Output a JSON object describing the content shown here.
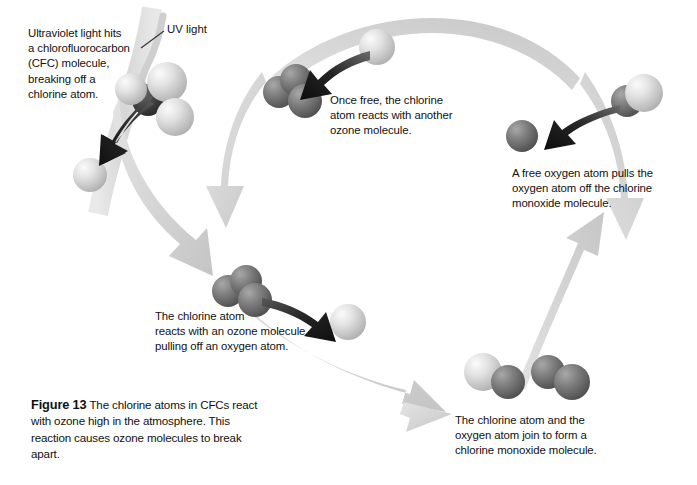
{
  "figure": {
    "number_label": "Figure 13",
    "caption_text": " The chlorine atoms in CFCs react with ozone high in the atmosphere. This reaction causes ozone molecules to break apart."
  },
  "annotations": {
    "uv_light_label": "UV light"
  },
  "steps": [
    {
      "id": "step1",
      "lines": [
        "Ultraviolet light hits",
        "a chlorofluorocarbon",
        "(CFC) molecule,",
        "breaking off a",
        "chlorine atom."
      ]
    },
    {
      "id": "step2",
      "lines": [
        "Once free, the chlorine",
        "atom reacts with another",
        "ozone molecule."
      ]
    },
    {
      "id": "step3",
      "lines": [
        "A free oxygen atom pulls the",
        "oxygen atom off the chlorine",
        "monoxide molecule."
      ]
    },
    {
      "id": "step4",
      "lines": [
        "The chlorine atom",
        "reacts with an ozone molecule,",
        "pulling off an oxygen atom."
      ]
    },
    {
      "id": "step5",
      "lines": [
        "The chlorine atom and the",
        "oxygen atom join to form a",
        "chlorine monoxide molecule."
      ]
    }
  ],
  "colors": {
    "background": "#ffffff",
    "cycle_arrow": "#d6d6d6",
    "cycle_arrow_shade": "#c2c2c2",
    "reaction_arrow": "#1a1a1a",
    "light_atom": "#cdcdcd",
    "light_atom_highlight": "#f2f2f2",
    "dark_atom": "#6d6d6d",
    "dark_atom_highlight": "#9a9a9a",
    "text": "#111111",
    "uv_beam": "#d9d9d9"
  },
  "molecules": [
    {
      "name": "cfc-molecule",
      "atoms": [
        "light",
        "light",
        "light",
        "dark"
      ]
    },
    {
      "name": "free-chlorine-atom",
      "atoms": [
        "light"
      ]
    },
    {
      "name": "ozone-molecule-upper",
      "atoms": [
        "dark",
        "dark",
        "dark"
      ]
    },
    {
      "name": "chlorine-atom-incoming",
      "atoms": [
        "light"
      ]
    },
    {
      "name": "chlorine-monoxide-molecule-upper",
      "atoms": [
        "dark",
        "light"
      ]
    },
    {
      "name": "free-oxygen-atom",
      "atoms": [
        "dark"
      ]
    },
    {
      "name": "ozone-molecule-lower",
      "atoms": [
        "dark",
        "dark",
        "dark"
      ]
    },
    {
      "name": "released-oxygen-atom",
      "atoms": [
        "light"
      ]
    },
    {
      "name": "chlorine-monoxide-molecule-lower",
      "atoms": [
        "light",
        "dark"
      ]
    },
    {
      "name": "oxygen-molecule",
      "atoms": [
        "dark",
        "dark"
      ]
    }
  ]
}
